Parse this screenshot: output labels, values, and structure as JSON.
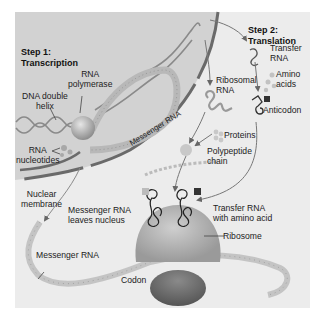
{
  "diagram": {
    "step1": {
      "line1": "Step 1:",
      "line2": "Transcription"
    },
    "step2": {
      "line1": "Step 2:",
      "line2": "Translation"
    },
    "labels": {
      "rna_polymerase_1": "RNA",
      "rna_polymerase_2": "polymerase",
      "dna_helix_1": "DNA double",
      "dna_helix_2": "helix",
      "rna_nucleotides_1": "RNA",
      "rna_nucleotides_2": "nucleotides",
      "messenger_rna_nucleus": "Messenger RNA",
      "nuclear_membrane_1": "Nuclear",
      "nuclear_membrane_2": "membrane",
      "mrna_leaves_1": "Messenger RNA",
      "mrna_leaves_2": "leaves nucleus",
      "messenger_rna": "Messenger RNA",
      "ribosomal_rna_1": "Ribosomal",
      "ribosomal_rna_2": "RNA",
      "transfer_rna_1": "Transfer",
      "transfer_rna_2": "RNA",
      "amino_acids_1": "Amino",
      "amino_acids_2": "acids",
      "anticodon": "Anticodon",
      "proteins": "Proteins",
      "polypeptide_1": "Polypeptide",
      "polypeptide_2": "chain",
      "trna_amino_1": "Transfer RNA",
      "trna_amino_2": "with amino acid",
      "ribosome": "Ribosome",
      "codon": "Codon"
    },
    "colors": {
      "panel": "#ececec",
      "nucleus": "#cfcfcf",
      "membrane": "#6a6a6a",
      "ribosome_top": "#b5b5b5",
      "ribosome_bottom": "#6e6e6e",
      "mrna": "#c4c4c4"
    }
  }
}
